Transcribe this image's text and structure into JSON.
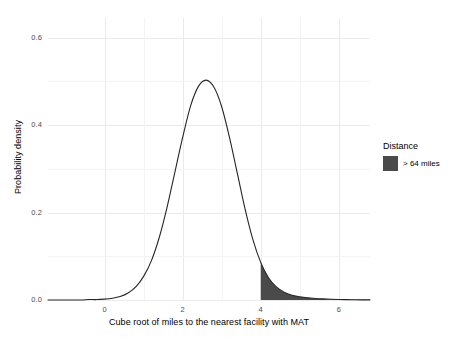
{
  "chart_data": {
    "type": "area",
    "title": "",
    "subtitle": "",
    "xlabel": "Cube root of miles to the nearest facility with MAT",
    "ylabel": "Probability density",
    "xlim": [
      -1.45,
      6.8
    ],
    "ylim": [
      0.0,
      0.645
    ],
    "grid": true,
    "legend_position": "right",
    "x_ticks": [
      0,
      2,
      4,
      6
    ],
    "x_tick_labels": [
      "0",
      "2",
      "4",
      "6"
    ],
    "y_ticks": [
      0.0,
      0.2,
      0.4,
      0.6
    ],
    "y_tick_labels": [
      "0.0",
      "0.2",
      "0.4",
      "0.6"
    ],
    "series": [
      {
        "name": "density",
        "kind": "line",
        "color": "#262626",
        "x": [
          -1.45,
          -1.2,
          -1.0,
          -0.8,
          -0.6,
          -0.4,
          -0.2,
          0.0,
          0.2,
          0.4,
          0.6,
          0.8,
          1.0,
          1.2,
          1.4,
          1.6,
          1.8,
          2.0,
          2.2,
          2.4,
          2.6,
          2.8,
          3.0,
          3.2,
          3.4,
          3.6,
          3.8,
          4.0,
          4.2,
          4.4,
          4.6,
          4.8,
          5.0,
          5.2,
          5.4,
          5.6,
          5.8,
          6.0,
          6.2,
          6.4,
          6.6,
          6.8
        ],
        "y": [
          0.0,
          0.0,
          0.0,
          0.0,
          0.0,
          0.001,
          0.001,
          0.002,
          0.004,
          0.008,
          0.016,
          0.03,
          0.054,
          0.09,
          0.143,
          0.212,
          0.292,
          0.372,
          0.443,
          0.488,
          0.503,
          0.487,
          0.442,
          0.372,
          0.29,
          0.208,
          0.138,
          0.086,
          0.051,
          0.03,
          0.018,
          0.011,
          0.0075,
          0.005,
          0.0035,
          0.0025,
          0.0018,
          0.0013,
          0.0009,
          0.0006,
          0.0004,
          0.0003
        ]
      },
      {
        "name": "> 64 miles",
        "kind": "shaded-tail",
        "color": "#4a4a4a",
        "x_start": 4.0,
        "x_end": 6.8,
        "x": [
          4.0,
          4.2,
          4.4,
          4.6,
          4.8,
          5.0,
          5.2,
          5.4,
          5.6,
          5.8,
          6.0,
          6.2,
          6.4,
          6.6,
          6.8
        ],
        "y": [
          0.086,
          0.051,
          0.03,
          0.018,
          0.011,
          0.0075,
          0.005,
          0.0035,
          0.0025,
          0.0018,
          0.0013,
          0.0009,
          0.0006,
          0.0004,
          0.0003
        ]
      }
    ],
    "annotations": {
      "peak_x": 2.66,
      "peak_y": 0.503,
      "shade_threshold_x": 4.0
    }
  },
  "legend": {
    "title": "Distance",
    "items": [
      {
        "label": "> 64 miles",
        "color": "#4a4a4a"
      }
    ]
  },
  "axes": {
    "x_title": "Cube root of miles to the nearest facility with MAT",
    "y_title": "Probability density"
  },
  "colors": {
    "background": "#ffffff",
    "curve": "#262626",
    "shade": "#4a4a4a",
    "gridline_major": "#ebebeb",
    "gridline_minor": "#f4f4f4",
    "tick_text": "#4d4d4d",
    "title_text": "#000000"
  }
}
